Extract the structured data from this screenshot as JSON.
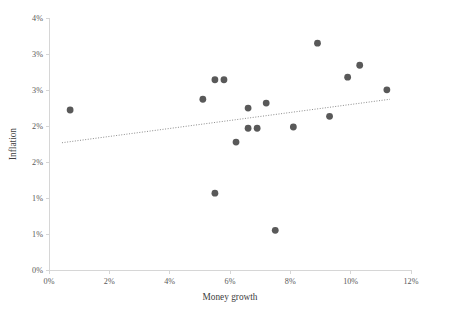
{
  "chart_data": {
    "type": "scatter",
    "title": "",
    "xlabel": "Money growth",
    "ylabel": "Inflation",
    "xlim": [
      0,
      12
    ],
    "ylim": [
      0,
      4
    ],
    "grid": false,
    "legend": null,
    "x_tick_labels": [
      "0%",
      "2%",
      "4%",
      "6%",
      "8%",
      "10%",
      "12%"
    ],
    "x_tick_values": [
      0,
      2,
      4,
      6,
      8,
      10,
      12
    ],
    "y_tick_labels": [
      "0%",
      "1%",
      "1%",
      "2%",
      "2%",
      "3%",
      "3%",
      "4%"
    ],
    "y_tick_values": [
      0,
      0.5,
      1,
      1.5,
      2,
      2.5,
      3,
      3.5,
      4
    ],
    "y_tick_labels_full": [
      "0%",
      "1%",
      "1%",
      "2%",
      "2%",
      "3%",
      "3%",
      "4%"
    ],
    "point_color": "#595959",
    "trendline_color": "#8c8c8c",
    "axis_color": "#d6d6d6",
    "points": [
      {
        "x": 0.7,
        "y": 2.54
      },
      {
        "x": 5.1,
        "y": 2.71
      },
      {
        "x": 5.5,
        "y": 3.02
      },
      {
        "x": 5.8,
        "y": 3.02
      },
      {
        "x": 5.5,
        "y": 1.22
      },
      {
        "x": 6.2,
        "y": 2.03
      },
      {
        "x": 6.6,
        "y": 2.25
      },
      {
        "x": 6.9,
        "y": 2.25
      },
      {
        "x": 6.6,
        "y": 2.57
      },
      {
        "x": 7.2,
        "y": 2.65
      },
      {
        "x": 7.5,
        "y": 0.63
      },
      {
        "x": 8.1,
        "y": 2.27
      },
      {
        "x": 8.9,
        "y": 3.6
      },
      {
        "x": 9.3,
        "y": 2.44
      },
      {
        "x": 9.9,
        "y": 3.06
      },
      {
        "x": 10.3,
        "y": 3.25
      },
      {
        "x": 11.2,
        "y": 2.86
      }
    ],
    "trendline": {
      "x_start": 0.43,
      "y_start": 2.02,
      "x_end": 11.3,
      "y_end": 2.71
    }
  }
}
